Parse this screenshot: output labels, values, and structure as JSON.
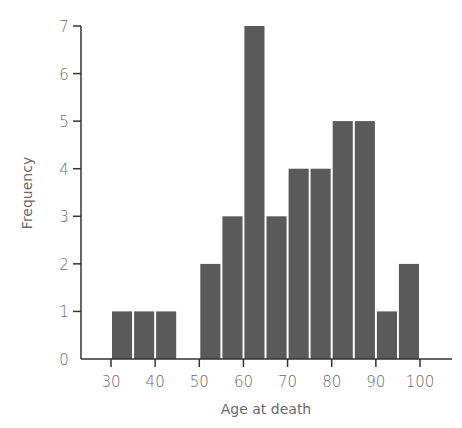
{
  "chart_data": {
    "type": "bar",
    "subtype": "histogram",
    "title": "",
    "xlabel": "Age at death",
    "ylabel": "Frequency",
    "bin_width": 5,
    "bins": [
      {
        "start": 30,
        "end": 35,
        "count": 1
      },
      {
        "start": 35,
        "end": 40,
        "count": 1
      },
      {
        "start": 40,
        "end": 45,
        "count": 1
      },
      {
        "start": 45,
        "end": 50,
        "count": 0
      },
      {
        "start": 50,
        "end": 55,
        "count": 2
      },
      {
        "start": 55,
        "end": 60,
        "count": 3
      },
      {
        "start": 60,
        "end": 65,
        "count": 7
      },
      {
        "start": 65,
        "end": 70,
        "count": 3
      },
      {
        "start": 70,
        "end": 75,
        "count": 4
      },
      {
        "start": 75,
        "end": 80,
        "count": 4
      },
      {
        "start": 80,
        "end": 85,
        "count": 5
      },
      {
        "start": 85,
        "end": 90,
        "count": 5
      },
      {
        "start": 90,
        "end": 95,
        "count": 1
      },
      {
        "start": 95,
        "end": 100,
        "count": 2
      }
    ],
    "categories": [
      "30-35",
      "35-40",
      "40-45",
      "45-50",
      "50-55",
      "55-60",
      "60-65",
      "65-70",
      "70-75",
      "75-80",
      "80-85",
      "85-90",
      "90-95",
      "95-100"
    ],
    "values": [
      1,
      1,
      1,
      0,
      2,
      3,
      7,
      3,
      4,
      4,
      5,
      5,
      1,
      2
    ],
    "xticks": [
      30,
      40,
      50,
      60,
      70,
      80,
      90,
      100
    ],
    "yticks": [
      0,
      1,
      2,
      3,
      4,
      5,
      6,
      7
    ],
    "xlim": [
      23,
      107
    ],
    "ylim": [
      0,
      7
    ],
    "grid": false,
    "legend": null,
    "bar_color": "#5a5a5a",
    "axis_color": "#333333"
  }
}
